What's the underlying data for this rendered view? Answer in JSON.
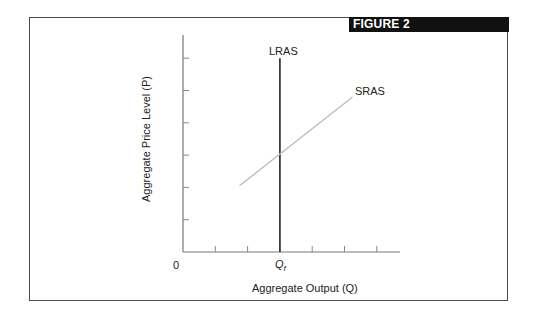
{
  "figure": {
    "banner_label": "FIGURE 2"
  },
  "chart_data": {
    "type": "line",
    "title": "FIGURE 2",
    "xlabel": "Aggregate Output (Q)",
    "ylabel": "Aggregate Price Level (P)",
    "origin_label": "0",
    "x_tick_labels": [
      {
        "position": 3,
        "label": "Qf",
        "main": "Q",
        "sub": "f"
      }
    ],
    "x_ticks": [
      1,
      2,
      3,
      4,
      5,
      6
    ],
    "y_ticks": [
      1,
      2,
      3,
      4,
      5,
      6
    ],
    "xlim": [
      0,
      6.7
    ],
    "ylim": [
      0,
      6.7
    ],
    "grid": false,
    "legend": "none",
    "series": [
      {
        "name": "LRAS",
        "style": "vertical",
        "color": "#3a3a3a",
        "points": [
          [
            3,
            0
          ],
          [
            3,
            6
          ]
        ]
      },
      {
        "name": "SRAS",
        "style": "upward-sloping",
        "color": "#bdbdbd",
        "points": [
          [
            1.75,
            2.05
          ],
          [
            5.25,
            4.8
          ]
        ]
      }
    ],
    "annotations": [
      {
        "text": "LRAS",
        "at": "top of LRAS line"
      },
      {
        "text": "SRAS",
        "at": "upper end of SRAS line"
      }
    ]
  }
}
